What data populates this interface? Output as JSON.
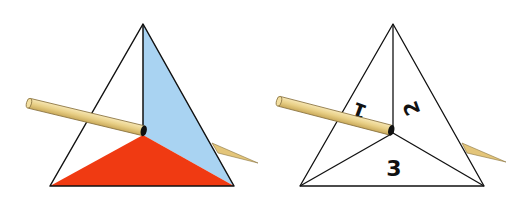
{
  "figures": [
    {
      "name": "colored-tetrahedron",
      "colors": {
        "left_face": "#ffffff",
        "right_face": "#a9d3f2",
        "bottom_face": "#f03a12",
        "outline": "#111111"
      }
    },
    {
      "name": "numbered-tetrahedron",
      "labels": {
        "face_1": "1",
        "face_2": "2",
        "face_3": "3"
      }
    }
  ],
  "stick": {
    "color": "#ecd592",
    "shade": "#c9a95a",
    "outline": "#7a6a3a"
  }
}
